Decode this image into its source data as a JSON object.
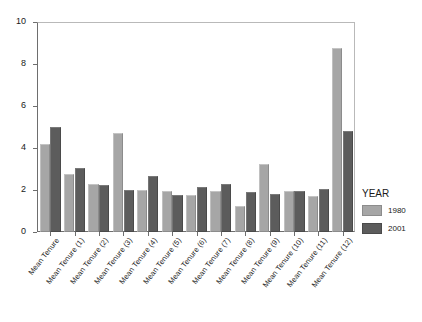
{
  "chart_data": {
    "type": "bar",
    "title": "",
    "xlabel": "",
    "ylabel": "",
    "ylim": [
      0,
      10
    ],
    "yticks": [
      0,
      2,
      4,
      6,
      8,
      10
    ],
    "grid": false,
    "legend_position": "right",
    "legend_title": "YEAR",
    "categories": [
      "Mean Tenure",
      "Mean Tenure (1)",
      "Mean Tenure (2)",
      "Mean Tenure (3)",
      "Mean Tenure (4)",
      "Mean Tenure (5)",
      "Mean Tenure (6)",
      "Mean Tenure (7)",
      "Mean Tenure (8)",
      "Mean Tenure (9)",
      "Mean Tenure (10)",
      "Mean Tenure (11)",
      "Mean Tenure (12)"
    ],
    "series": [
      {
        "name": "1980",
        "color": "#a6a6a6",
        "values": [
          4.2,
          2.75,
          2.3,
          4.7,
          2.0,
          1.95,
          1.75,
          1.95,
          1.25,
          3.25,
          1.95,
          1.7,
          8.75
        ]
      },
      {
        "name": "2001",
        "color": "#5c5c5c",
        "values": [
          5.0,
          3.05,
          2.25,
          2.0,
          2.65,
          1.75,
          2.15,
          2.3,
          1.9,
          1.8,
          1.95,
          2.05,
          4.8
        ]
      }
    ]
  },
  "legend": {
    "title": "YEAR",
    "items": [
      {
        "label": "1980",
        "color": "#a6a6a6"
      },
      {
        "label": "2001",
        "color": "#5c5c5c"
      }
    ]
  },
  "axes": {
    "y_tick_labels": [
      "10",
      "8",
      "6",
      "4",
      "2",
      "0"
    ]
  }
}
